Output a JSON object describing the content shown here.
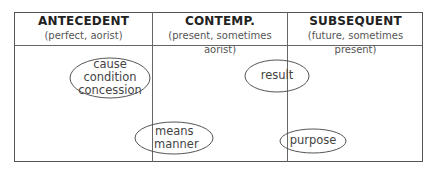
{
  "columns": [
    {
      "title": "ANTECEDENT",
      "subtitle": "(perfect, aorist)"
    },
    {
      "title": "CONTEMP.",
      "subtitle": "(present, sometimes aorist)"
    },
    {
      "title": "SUBSEQUENT",
      "subtitle": "(future, sometimes present)"
    }
  ],
  "ellipses": [
    {
      "lines": [
        "cause",
        "condition",
        "concession"
      ],
      "cx": 110,
      "cy": 78,
      "rx": 40,
      "ry": 20
    },
    {
      "lines": [
        "result"
      ],
      "cx": 277,
      "cy": 76,
      "rx": 32,
      "ry": 16
    },
    {
      "lines": [
        "means",
        "manner"
      ],
      "cx": 174,
      "cy": 138,
      "rx": 39,
      "ry": 16
    },
    {
      "lines": [
        "purpose"
      ],
      "cx": 313,
      "cy": 141,
      "rx": 33,
      "ry": 12
    }
  ],
  "colors": {
    "line": "#555555",
    "text": "#333333"
  }
}
